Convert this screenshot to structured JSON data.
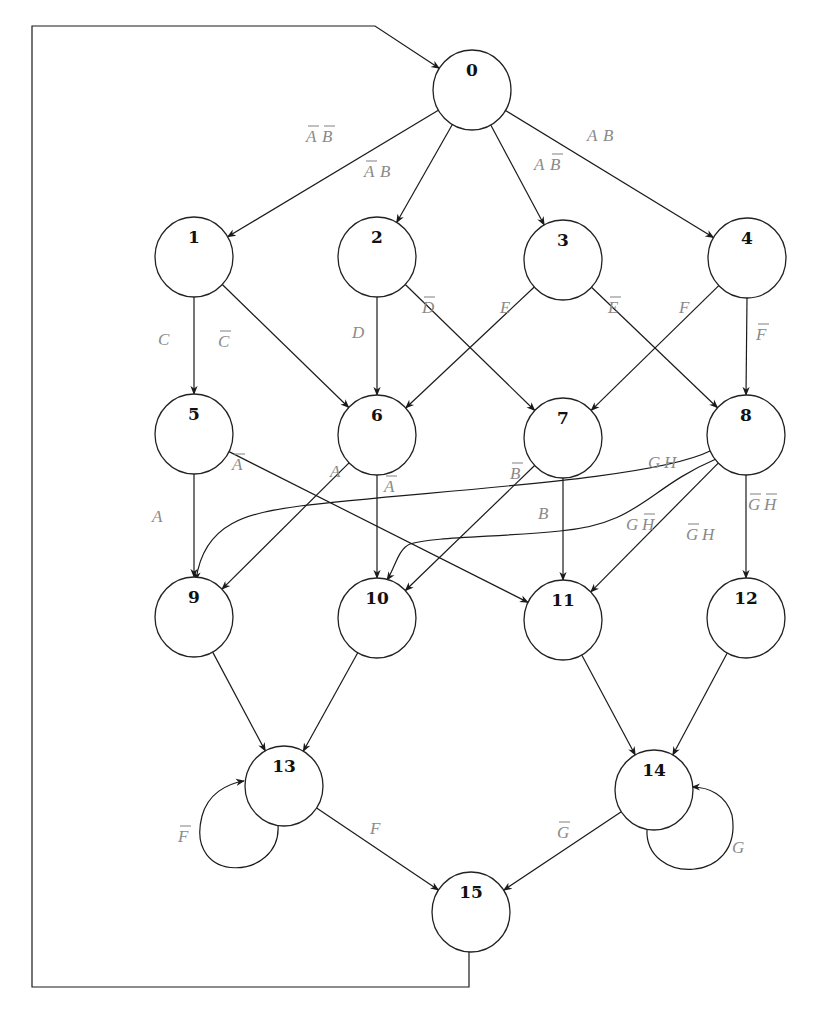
{
  "diagram": {
    "colors": {
      "node_stroke": "#222222",
      "edge": "#1a1a1a",
      "label": "#8a8a8a",
      "background": "#ffffff"
    },
    "node_rx": 39,
    "node_ry": 40,
    "nodes": [
      {
        "id": "0",
        "label": "0",
        "cx": 472,
        "cy": 90
      },
      {
        "id": "1",
        "label": "1",
        "cx": 194,
        "cy": 257
      },
      {
        "id": "2",
        "label": "2",
        "cx": 377,
        "cy": 257
      },
      {
        "id": "3",
        "label": "3",
        "cx": 563,
        "cy": 260
      },
      {
        "id": "4",
        "label": "4",
        "cx": 747,
        "cy": 258
      },
      {
        "id": "5",
        "label": "5",
        "cx": 194,
        "cy": 434
      },
      {
        "id": "6",
        "label": "6",
        "cx": 377,
        "cy": 435
      },
      {
        "id": "7",
        "label": "7",
        "cx": 563,
        "cy": 438
      },
      {
        "id": "8",
        "label": "8",
        "cx": 746,
        "cy": 435
      },
      {
        "id": "9",
        "label": "9",
        "cx": 194,
        "cy": 617
      },
      {
        "id": "10",
        "label": "10",
        "cx": 377,
        "cy": 618
      },
      {
        "id": "11",
        "label": "11",
        "cx": 563,
        "cy": 620
      },
      {
        "id": "12",
        "label": "12",
        "cx": 746,
        "cy": 618
      },
      {
        "id": "13",
        "label": "13",
        "cx": 284,
        "cy": 786
      },
      {
        "id": "14",
        "label": "14",
        "cx": 654,
        "cy": 790
      },
      {
        "id": "15",
        "label": "15",
        "cx": 471,
        "cy": 912
      }
    ],
    "edges": [
      {
        "from": "0",
        "to": "1",
        "label": [
          {
            "t": "A",
            "bar": true
          },
          {
            "t": "B",
            "bar": true
          }
        ],
        "lx": 306,
        "ly": 142
      },
      {
        "from": "0",
        "to": "2",
        "label": [
          {
            "t": "A",
            "bar": true
          },
          {
            "t": "B",
            "bar": false
          }
        ],
        "lx": 364,
        "ly": 177
      },
      {
        "from": "0",
        "to": "3",
        "label": [
          {
            "t": "A",
            "bar": false
          },
          {
            "t": "B",
            "bar": true
          }
        ],
        "lx": 534,
        "ly": 170
      },
      {
        "from": "0",
        "to": "4",
        "label": [
          {
            "t": "A",
            "bar": false
          },
          {
            "t": "B",
            "bar": false
          }
        ],
        "lx": 587,
        "ly": 141
      },
      {
        "from": "1",
        "to": "5",
        "label": [
          {
            "t": "C",
            "bar": false
          }
        ],
        "lx": 158,
        "ly": 345
      },
      {
        "from": "1",
        "to": "6",
        "label": [
          {
            "t": "C",
            "bar": true
          }
        ],
        "lx": 218,
        "ly": 347
      },
      {
        "from": "2",
        "to": "6",
        "label": [
          {
            "t": "D",
            "bar": false
          }
        ],
        "lx": 352,
        "ly": 338
      },
      {
        "from": "2",
        "to": "7",
        "label": [
          {
            "t": "D",
            "bar": true
          }
        ],
        "lx": 422,
        "ly": 313
      },
      {
        "from": "3",
        "to": "6",
        "label": [
          {
            "t": "E",
            "bar": false
          }
        ],
        "lx": 500,
        "ly": 313
      },
      {
        "from": "3",
        "to": "8",
        "label": [
          {
            "t": "E",
            "bar": true
          }
        ],
        "lx": 608,
        "ly": 313
      },
      {
        "from": "4",
        "to": "7",
        "label": [
          {
            "t": "F",
            "bar": false
          }
        ],
        "lx": 679,
        "ly": 313
      },
      {
        "from": "4",
        "to": "8",
        "label": [
          {
            "t": "F",
            "bar": true
          }
        ],
        "lx": 756,
        "ly": 340
      },
      {
        "from": "5",
        "to": "9",
        "label": [
          {
            "t": "A",
            "bar": false
          }
        ],
        "lx": 152,
        "ly": 522
      },
      {
        "from": "5",
        "to": "11",
        "label": [
          {
            "t": "A",
            "bar": true
          }
        ],
        "lx": 232,
        "ly": 470
      },
      {
        "from": "6",
        "to": "9",
        "label": [
          {
            "t": "A",
            "bar": false
          }
        ],
        "lx": 330,
        "ly": 477
      },
      {
        "from": "6",
        "to": "10",
        "label": [
          {
            "t": "A",
            "bar": true
          }
        ],
        "lx": 384,
        "ly": 492
      },
      {
        "from": "7",
        "to": "10",
        "label": [
          {
            "t": "B",
            "bar": true
          }
        ],
        "lx": 510,
        "ly": 479
      },
      {
        "from": "7",
        "to": "11",
        "label": [
          {
            "t": "B",
            "bar": false
          }
        ],
        "lx": 538,
        "ly": 519
      },
      {
        "from": "8",
        "to": "9",
        "label": [
          {
            "t": "G",
            "bar": false
          },
          {
            "t": "H",
            "bar": false
          }
        ],
        "lx": 648,
        "ly": 468
      },
      {
        "from": "8",
        "to": "10",
        "label": [
          {
            "t": "G",
            "bar": false
          },
          {
            "t": "H",
            "bar": true
          }
        ],
        "lx": 626,
        "ly": 530
      },
      {
        "from": "8",
        "to": "11",
        "label": [
          {
            "t": "G",
            "bar": true
          },
          {
            "t": "H",
            "bar": false
          }
        ],
        "lx": 686,
        "ly": 540
      },
      {
        "from": "8",
        "to": "12",
        "label": [
          {
            "t": "G",
            "bar": true
          },
          {
            "t": "H",
            "bar": true
          }
        ],
        "lx": 748,
        "ly": 510
      },
      {
        "from": "9",
        "to": "13",
        "label": []
      },
      {
        "from": "10",
        "to": "13",
        "label": []
      },
      {
        "from": "11",
        "to": "14",
        "label": []
      },
      {
        "from": "12",
        "to": "14",
        "label": []
      },
      {
        "from": "13",
        "to": "13",
        "label": [
          {
            "t": "F",
            "bar": true
          }
        ],
        "lx": 178,
        "ly": 842
      },
      {
        "from": "13",
        "to": "15",
        "label": [
          {
            "t": "F",
            "bar": false
          }
        ],
        "lx": 370,
        "ly": 834
      },
      {
        "from": "14",
        "to": "14",
        "label": [
          {
            "t": "G",
            "bar": false
          }
        ],
        "lx": 732,
        "ly": 853
      },
      {
        "from": "14",
        "to": "15",
        "label": [
          {
            "t": "G",
            "bar": true
          }
        ],
        "lx": 557,
        "ly": 838
      },
      {
        "from": "15",
        "to": "0",
        "label": []
      }
    ]
  }
}
